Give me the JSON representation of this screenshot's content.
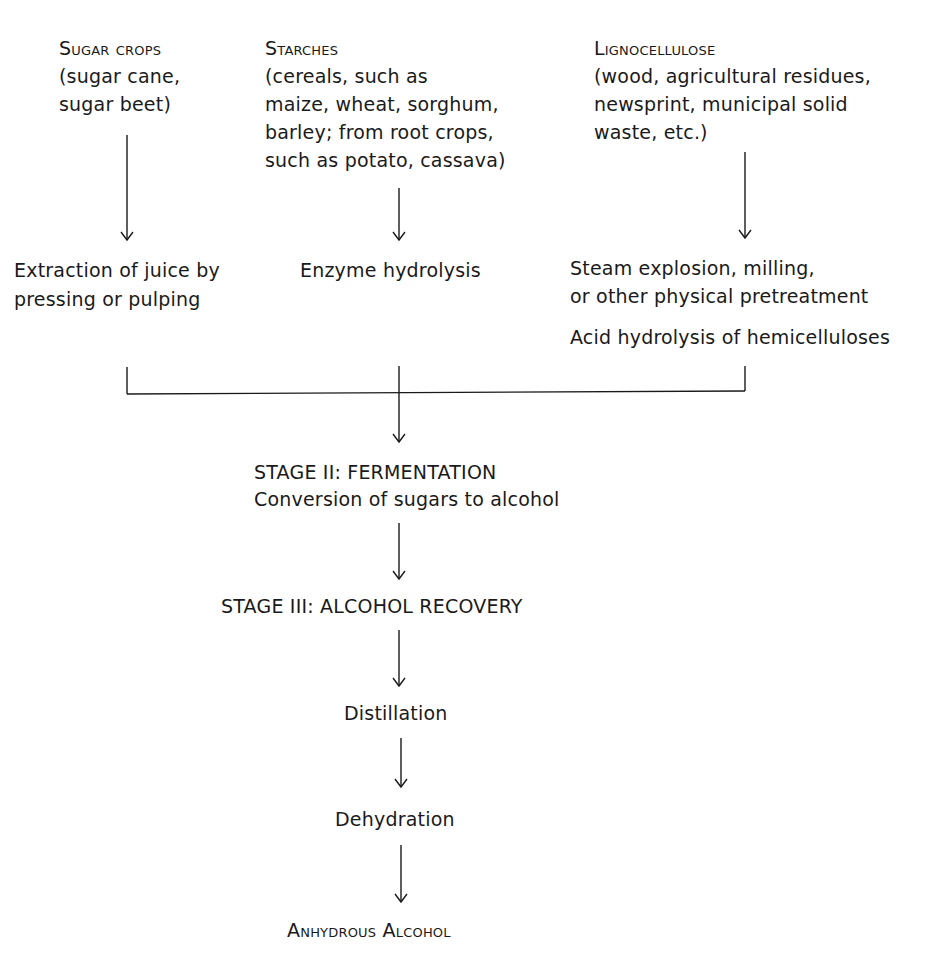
{
  "feedstocks": [
    {
      "title": "Sugar Crops",
      "lines": [
        "(sugar cane,",
        "sugar beet)"
      ],
      "process": [
        "Extraction of juice by",
        "pressing or pulping"
      ]
    },
    {
      "title": "Starches",
      "lines": [
        "(cereals, such as",
        "maize, wheat, sorghum,",
        "barley; from root crops,",
        "such as potato, cassava)"
      ],
      "process": [
        "Enzyme hydrolysis"
      ]
    },
    {
      "title": "Lignocellulose",
      "lines": [
        "(wood, agricultural residues,",
        "newsprint, municipal solid",
        "waste, etc.)"
      ],
      "process": [
        "Steam explosion, milling,",
        "or other physical pretreatment"
      ],
      "process2": "Acid hydrolysis of hemicelluloses"
    }
  ],
  "stage2": {
    "title": "STAGE II: FERMENTATION",
    "subtitle": "Conversion of sugars to alcohol"
  },
  "stage3": {
    "title": "STAGE III: ALCOHOL RECOVERY"
  },
  "steps": [
    "Distillation",
    "Dehydration"
  ],
  "product": "Anhydrous Alcohol",
  "colors": {
    "ink": "#1a1a1a",
    "background": "#ffffff"
  }
}
